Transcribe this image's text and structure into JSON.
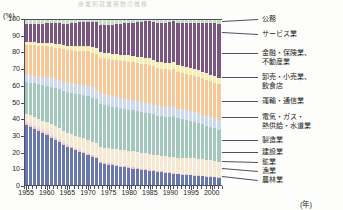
{
  "figure": {
    "ghost_title": "産業別就業者数の推移",
    "y_unit": "(%)",
    "x_unit": "(年)"
  },
  "axes": {
    "y_ticks": [
      "0",
      "10",
      "20",
      "30",
      "40",
      "50",
      "60",
      "70",
      "80",
      "90",
      "100"
    ],
    "x_ticks": [
      "1955",
      "1960",
      "1965",
      "1970",
      "1975",
      "1980",
      "1985",
      "1990",
      "1995",
      "2000"
    ]
  },
  "legend": {
    "items": [
      {
        "label": "公務",
        "color": "#c9dfc4"
      },
      {
        "label": "サービス業",
        "color": "#7b5480"
      },
      {
        "label": "金融・保険業、",
        "color": "#f6efb2"
      },
      {
        "label": "不動産業",
        "color": "#f6efb2"
      },
      {
        "label": "卸売・小売業、",
        "color": "#f7c896"
      },
      {
        "label": "飲食店",
        "color": "#f7c896"
      },
      {
        "label": "運輸・通信業",
        "color": "#cdd9ef"
      },
      {
        "label": "電気・ガス・",
        "color": "#a9c4dd"
      },
      {
        "label": "熱供給・水道業",
        "color": "#a9c4dd"
      },
      {
        "label": "製造業",
        "color": "#a3c7bb"
      },
      {
        "label": "建設業",
        "color": "#f6e7d0"
      },
      {
        "label": "鉱業",
        "color": "#f3d9d9"
      },
      {
        "label": "漁業",
        "color": "#eec3c8"
      },
      {
        "label": "農林業",
        "color": "#6878ac"
      }
    ]
  },
  "chart_data": {
    "type": "area",
    "title": "産業別就業者数の推移",
    "xlabel": "(年)",
    "ylabel": "(%)",
    "ylim": [
      0,
      100
    ],
    "grid": false,
    "legend_position": "right",
    "stacked_percent": true,
    "x": [
      1955,
      1956,
      1957,
      1958,
      1959,
      1960,
      1961,
      1962,
      1963,
      1964,
      1965,
      1966,
      1967,
      1968,
      1969,
      1970,
      1971,
      1972,
      1973,
      1974,
      1975,
      1976,
      1977,
      1978,
      1979,
      1980,
      1981,
      1982,
      1983,
      1984,
      1985,
      1986,
      1987,
      1988,
      1989,
      1990,
      1991,
      1992,
      1993,
      1994,
      1995,
      1996,
      1997,
      1998,
      1999,
      2000,
      2001,
      2002
    ],
    "series": [
      {
        "name": "農林業",
        "color": "#6878ac",
        "values": [
          36.0,
          34.8,
          33.6,
          32.4,
          31.2,
          30.0,
          28.6,
          27.2,
          25.8,
          24.4,
          23.0,
          22.0,
          21.0,
          20.0,
          19.0,
          17.9,
          17.0,
          16.1,
          13.3,
          12.7,
          12.2,
          11.8,
          11.4,
          11.0,
          10.6,
          10.2,
          9.9,
          9.6,
          9.3,
          9.0,
          8.7,
          8.4,
          8.1,
          7.8,
          7.5,
          7.2,
          6.9,
          6.6,
          6.4,
          6.2,
          6.0,
          5.8,
          5.6,
          5.4,
          5.2,
          5.0,
          4.8,
          4.6
        ]
      },
      {
        "name": "漁業",
        "color": "#eec3c8",
        "values": [
          1.3,
          1.3,
          1.3,
          1.2,
          1.2,
          1.2,
          1.1,
          1.1,
          1.1,
          1.0,
          1.0,
          1.0,
          0.9,
          0.9,
          0.9,
          0.9,
          0.8,
          0.8,
          0.8,
          0.8,
          0.8,
          0.8,
          0.7,
          0.7,
          0.7,
          0.7,
          0.7,
          0.7,
          0.6,
          0.6,
          0.6,
          0.6,
          0.6,
          0.6,
          0.5,
          0.5,
          0.5,
          0.5,
          0.5,
          0.5,
          0.5,
          0.4,
          0.4,
          0.4,
          0.4,
          0.4,
          0.4,
          0.4
        ]
      },
      {
        "name": "鉱業",
        "color": "#f3d9d9",
        "values": [
          1.2,
          1.2,
          1.2,
          1.1,
          1.1,
          1.1,
          1.0,
          1.0,
          0.9,
          0.9,
          0.8,
          0.8,
          0.7,
          0.7,
          0.6,
          0.6,
          0.5,
          0.5,
          0.5,
          0.4,
          0.4,
          0.4,
          0.4,
          0.3,
          0.3,
          0.3,
          0.3,
          0.3,
          0.3,
          0.2,
          0.2,
          0.2,
          0.2,
          0.2,
          0.2,
          0.2,
          0.2,
          0.1,
          0.1,
          0.1,
          0.1,
          0.1,
          0.1,
          0.1,
          0.1,
          0.1,
          0.1,
          0.1
        ]
      },
      {
        "name": "建設業",
        "color": "#f6e7d0",
        "values": [
          4.5,
          4.7,
          4.9,
          5.1,
          5.3,
          5.5,
          5.8,
          6.0,
          6.3,
          6.5,
          6.8,
          7.0,
          7.2,
          7.4,
          7.6,
          7.7,
          7.9,
          8.1,
          8.4,
          8.6,
          8.8,
          9.0,
          9.2,
          9.4,
          9.5,
          9.6,
          9.5,
          9.4,
          9.3,
          9.2,
          9.1,
          9.2,
          9.3,
          9.4,
          9.5,
          9.6,
          9.8,
          10.0,
          10.2,
          10.3,
          10.4,
          10.4,
          10.3,
          10.2,
          10.1,
          10.0,
          9.8,
          9.6
        ]
      },
      {
        "name": "製造業",
        "color": "#a3c7bb",
        "values": [
          18.4,
          19.0,
          19.6,
          20.2,
          20.8,
          21.4,
          22.0,
          22.5,
          23.0,
          23.5,
          24.0,
          24.4,
          24.8,
          25.2,
          25.6,
          26.1,
          26.0,
          25.8,
          25.6,
          25.4,
          25.1,
          24.8,
          24.6,
          24.4,
          24.3,
          24.2,
          24.1,
          24.0,
          24.0,
          24.1,
          24.2,
          24.1,
          23.9,
          23.8,
          23.9,
          24.1,
          24.3,
          24.2,
          23.8,
          23.4,
          22.9,
          22.4,
          22.0,
          21.5,
          20.9,
          20.5,
          20.0,
          19.5
        ]
      },
      {
        "name": "電気・ガス・熱供給・水道業",
        "color": "#a9c4dd",
        "values": [
          0.6,
          0.6,
          0.6,
          0.6,
          0.6,
          0.6,
          0.6,
          0.6,
          0.6,
          0.5,
          0.5,
          0.5,
          0.5,
          0.5,
          0.5,
          0.5,
          0.5,
          0.5,
          0.5,
          0.5,
          0.5,
          0.5,
          0.5,
          0.5,
          0.5,
          0.5,
          0.5,
          0.5,
          0.5,
          0.5,
          0.5,
          0.5,
          0.5,
          0.5,
          0.5,
          0.5,
          0.5,
          0.5,
          0.5,
          0.5,
          0.5,
          0.5,
          0.5,
          0.5,
          0.5,
          0.5,
          0.5,
          0.5
        ]
      },
      {
        "name": "運輸・通信業",
        "color": "#cdd9ef",
        "values": [
          4.5,
          4.6,
          4.7,
          4.8,
          4.9,
          5.0,
          5.1,
          5.2,
          5.3,
          5.4,
          5.5,
          5.6,
          5.7,
          5.8,
          5.9,
          6.0,
          6.1,
          6.2,
          6.3,
          6.3,
          6.3,
          6.3,
          6.2,
          6.2,
          6.2,
          6.1,
          6.1,
          6.1,
          6.0,
          6.0,
          5.9,
          5.9,
          5.9,
          5.9,
          5.9,
          5.9,
          6.0,
          6.0,
          6.1,
          6.1,
          6.1,
          6.1,
          6.1,
          6.1,
          6.1,
          6.1,
          6.1,
          6.1
        ]
      },
      {
        "name": "卸売・小売業、飲食店",
        "color": "#f7c896",
        "values": [
          17.8,
          18.0,
          18.2,
          18.4,
          18.6,
          18.8,
          19.0,
          19.2,
          19.4,
          19.6,
          19.8,
          20.0,
          20.2,
          20.4,
          20.6,
          20.8,
          21.0,
          21.2,
          21.4,
          21.6,
          21.8,
          22.0,
          22.2,
          22.4,
          22.6,
          22.8,
          22.9,
          23.0,
          23.1,
          23.2,
          23.3,
          23.3,
          23.3,
          23.2,
          23.1,
          23.0,
          22.9,
          22.8,
          22.8,
          22.7,
          22.7,
          22.6,
          22.6,
          22.6,
          22.5,
          22.5,
          22.4,
          22.4
        ]
      },
      {
        "name": "金融・保険業、不動産業",
        "color": "#f6efb2",
        "values": [
          1.7,
          1.8,
          1.9,
          2.0,
          2.0,
          2.1,
          2.2,
          2.3,
          2.4,
          2.5,
          2.6,
          2.7,
          2.8,
          2.9,
          3.0,
          3.1,
          3.2,
          3.3,
          3.4,
          3.4,
          3.5,
          3.5,
          3.6,
          3.6,
          3.7,
          3.7,
          3.8,
          3.8,
          3.9,
          3.9,
          4.0,
          4.0,
          4.1,
          4.2,
          4.2,
          4.3,
          4.3,
          4.3,
          4.3,
          4.3,
          4.2,
          4.2,
          4.2,
          4.1,
          4.1,
          4.0,
          4.0,
          3.9
        ]
      },
      {
        "name": "サービス業",
        "color": "#7b5480",
        "values": [
          10.8,
          11.0,
          11.2,
          11.4,
          11.6,
          11.8,
          12.1,
          12.4,
          12.7,
          13.0,
          13.3,
          13.6,
          13.9,
          14.2,
          14.5,
          14.8,
          15.2,
          15.6,
          16.0,
          16.5,
          17.0,
          17.5,
          18.0,
          18.5,
          19.0,
          19.5,
          20.1,
          20.7,
          21.3,
          21.9,
          22.5,
          23.0,
          23.5,
          24.0,
          24.5,
          25.0,
          25.7,
          26.4,
          27.0,
          27.6,
          28.3,
          29.0,
          29.8,
          30.6,
          31.5,
          32.3,
          33.2,
          34.1
        ]
      },
      {
        "name": "公務",
        "color": "#c9dfc4",
        "values": [
          3.2,
          3.0,
          2.8,
          2.8,
          2.7,
          2.5,
          2.5,
          2.5,
          2.5,
          2.7,
          2.7,
          2.4,
          2.3,
          2.0,
          1.8,
          1.6,
          1.8,
          1.9,
          3.8,
          3.8,
          3.6,
          3.4,
          3.2,
          3.0,
          2.6,
          2.4,
          2.1,
          1.9,
          1.7,
          1.4,
          1.0,
          1.8,
          2.6,
          2.4,
          2.2,
          1.7,
          1.0,
          2.6,
          2.3,
          2.3,
          2.3,
          2.5,
          2.4,
          2.5,
          2.6,
          2.6,
          2.7,
          2.8
        ]
      }
    ]
  }
}
